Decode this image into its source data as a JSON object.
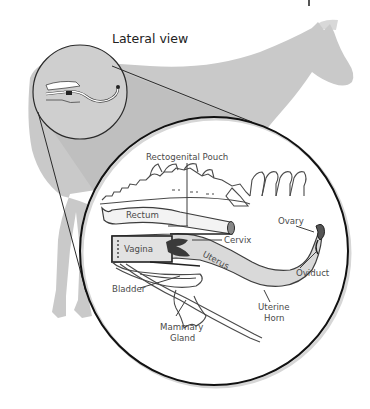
{
  "figure": {
    "title": "Lateral view",
    "corner_fragment": "",
    "colors": {
      "background": "#ffffff",
      "horse_silhouette": "#c9c9c9",
      "magnifier_cone": "#bdbdbd",
      "circle_stroke": "#1a1a1a",
      "organ_fill": "#d9d9d9",
      "organ_dark": "#3a3a3a",
      "label_text": "#4a4a4a"
    }
  },
  "inset": {
    "description": "Magnified detail of the mare reproductive tract, lateral view",
    "labels": {
      "rectogenital_pouch": "Rectogenital Pouch",
      "rectum": "Rectum",
      "vagina": "Vagina",
      "cervix": "Cervix",
      "uterus": "Uterus",
      "bladder": "Bladder",
      "mammary_gland_line1": "Mammary",
      "mammary_gland_line2": "Gland",
      "uterine_horn_line1": "Uterine",
      "uterine_horn_line2": "Horn",
      "ovary": "Ovary",
      "oviduct": "Oviduct"
    }
  }
}
